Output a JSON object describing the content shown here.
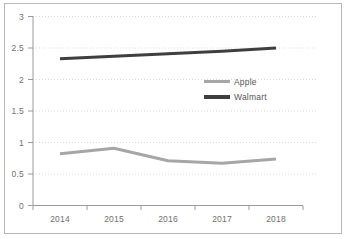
{
  "chart_data": {
    "type": "line",
    "title": "",
    "subtitle": "",
    "xlabel": "",
    "ylabel": "",
    "categories": [
      "2014",
      "2015",
      "2016",
      "2017",
      "2018"
    ],
    "x": [
      2014,
      2015,
      2016,
      2017,
      2018
    ],
    "ylim": [
      0,
      3
    ],
    "yticks": [
      "0",
      "0.5",
      "1",
      "1.5",
      "2",
      "2.5",
      "3"
    ],
    "ytick_values": [
      0,
      0.5,
      1,
      1.5,
      2,
      2.5,
      3
    ],
    "grid": "horizontal-dotted",
    "legend_position": "inside-right-center",
    "series": [
      {
        "name": "Apple",
        "color": "#a6a6a6",
        "values": [
          0.82,
          0.91,
          0.71,
          0.67,
          0.74
        ]
      },
      {
        "name": "Walmart",
        "color": "#3f3f3f",
        "values": [
          2.33,
          2.37,
          2.41,
          2.45,
          2.5
        ]
      }
    ],
    "annotations": []
  },
  "axes": {
    "y_tick_labels": [
      "3",
      "2.5",
      "2",
      "1.5",
      "1",
      "0.5",
      "0"
    ],
    "x_tick_labels": [
      "2014",
      "2015",
      "2016",
      "2017",
      "2018"
    ]
  },
  "legend": {
    "entries": [
      {
        "label": "Apple",
        "color": "#a6a6a6"
      },
      {
        "label": "Walmart",
        "color": "#3f3f3f"
      }
    ]
  },
  "colors": {
    "frame": "#b8b8b8",
    "axis": "#9a9a9a",
    "grid": "#d9d9d9",
    "tick_text": "#6f6f6f",
    "apple": "#a6a6a6",
    "walmart": "#3f3f3f",
    "background": "#ffffff"
  }
}
